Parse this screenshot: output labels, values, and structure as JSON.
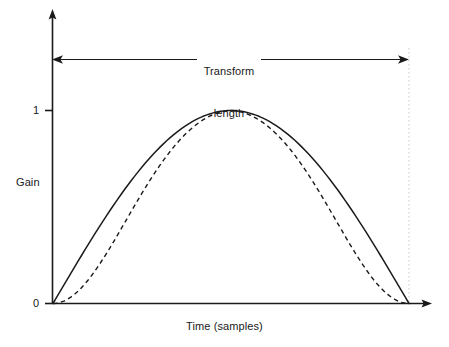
{
  "figure": {
    "background_color": "#ffffff",
    "ink_color": "#1a1a1a",
    "width": 449,
    "height": 347
  },
  "axes": {
    "y_label": "Gain",
    "x_label": "Time (samples)",
    "y_ticks": [
      {
        "value": 1,
        "label": "1"
      },
      {
        "value": 0,
        "label": "0"
      }
    ]
  },
  "annotation": {
    "line1": "Transform",
    "line2": "length",
    "style": "double-headed-arrow",
    "span_start_x": 53,
    "span_end_x": 409
  },
  "chart_data": {
    "type": "line",
    "title": "",
    "xlabel": "Time (samples)",
    "ylabel": "Gain",
    "xlim": [
      0,
      1
    ],
    "ylim": [
      0,
      1.05
    ],
    "grid": false,
    "legend": null,
    "annotations": [
      {
        "text": "Transform length",
        "type": "double_arrow",
        "x_start": 0.0,
        "x_end": 1.0,
        "y": 1.32
      }
    ],
    "y_tick_values": [
      0,
      1
    ],
    "y_tick_labels": [
      "0",
      "1"
    ],
    "x": [
      0,
      0.02,
      0.04,
      0.06,
      0.08,
      0.1,
      0.12,
      0.14,
      0.16,
      0.18,
      0.2,
      0.22,
      0.24,
      0.26,
      0.28,
      0.3,
      0.32,
      0.34,
      0.36,
      0.38,
      0.4,
      0.42,
      0.44,
      0.46,
      0.48,
      0.5,
      0.52,
      0.54,
      0.56,
      0.58,
      0.6,
      0.62,
      0.64,
      0.66,
      0.68,
      0.7,
      0.72,
      0.74,
      0.76,
      0.78,
      0.8,
      0.82,
      0.84,
      0.86,
      0.88,
      0.9,
      0.92,
      0.94,
      0.96,
      0.98,
      1.0
    ],
    "series": [
      {
        "name": "sine window",
        "style": "solid",
        "color": "#1a1a1a",
        "values": [
          0.0,
          0.0314,
          0.0628,
          0.0941,
          0.1253,
          0.1564,
          0.1874,
          0.2181,
          0.2487,
          0.279,
          0.309,
          0.3387,
          0.3681,
          0.3971,
          0.4258,
          0.454,
          0.4818,
          0.509,
          0.5358,
          0.5621,
          0.5878,
          0.6129,
          0.6374,
          0.6613,
          0.6845,
          0.7071,
          0.729,
          0.7501,
          0.7705,
          0.7902,
          0.809,
          0.8271,
          0.8443,
          0.8607,
          0.8763,
          0.891,
          0.9048,
          0.9178,
          0.9298,
          0.9409,
          0.9511,
          0.9603,
          0.9686,
          0.9759,
          0.9823,
          0.9877,
          0.9921,
          0.9956,
          0.998,
          0.9995,
          1.0
        ]
      },
      {
        "name": "raised-cosine (Tukey) window",
        "style": "dashed",
        "color": "#1a1a1a",
        "values": [
          0.0,
          0.001,
          0.0039,
          0.0087,
          0.0155,
          0.024,
          0.0343,
          0.0462,
          0.0598,
          0.0747,
          0.091,
          0.1086,
          0.1273,
          0.1469,
          0.1675,
          0.1888,
          0.2107,
          0.2332,
          0.256,
          0.2791,
          0.3024,
          0.3257,
          0.3489,
          0.372,
          0.3948,
          0.4173,
          0.4394,
          0.461,
          0.482,
          0.5024,
          0.5221,
          0.5411,
          0.5594,
          0.5769,
          0.5935,
          0.6092,
          0.6241,
          0.638,
          0.651,
          0.663,
          0.6741,
          0.6842,
          0.6933,
          0.7014,
          0.7085,
          0.7146,
          0.7197,
          0.7238,
          0.7269,
          0.729,
          0.73
        ]
      }
    ],
    "note": "Two symmetric window functions plotted over the transform length; both start and end at gain 0 and peak at gain 1. The solid curve is a sine (half-cycle) window; the dashed curve is a steeper raised-cosine style window with a flatter top and flatter tails."
  }
}
